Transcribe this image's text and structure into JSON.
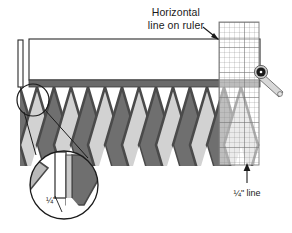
{
  "figure": {
    "title_alt": "Trimming a pieced diamond border with a rotary cutter and ruler",
    "background_color": "#ffffff"
  },
  "annotations": {
    "horizontal_line_label": {
      "line1": "Horizontal",
      "line2": "line on ruler"
    },
    "quarter_inch_line_label": "¼\" line",
    "zoom_measure_label": "¼\""
  },
  "colors": {
    "diamond_dark": "#6f6f6f",
    "diamond_light": "#d2d2d2",
    "diamond_outline": "#4a4a4a",
    "seam_strip": "#6a6a6a",
    "fabric_white": "#ffffff",
    "ruler_grid": "#8c8c8c",
    "ruler_fill": "#f2f2f2",
    "cutter_blade": "#1a1a1a",
    "cutter_handle": "#d8d8d8",
    "outline": "#2b2b2b",
    "leader_line": "#1a1a1a"
  },
  "geometry": {
    "canvas_width": 292,
    "canvas_height": 233,
    "diamond_count": 11,
    "diamond_half_width": 17,
    "diamond_height": 58,
    "band_top_y": 39,
    "band_bottom_y": 80,
    "seam_strip_y": 80,
    "seam_strip_height": 7,
    "ruler_x": 219,
    "ruler_width": 40,
    "ruler_top_y": 22,
    "ruler_bottom_y": 165,
    "ruler_grid_step": 5
  },
  "parts": {
    "ruler": "quilting-ruler",
    "rotary_cutter": "rotary-cutter",
    "fabric_band": "fabric-strip",
    "diamond_border": "pieced-diamond-border",
    "magnifier": "detail-magnifier"
  }
}
